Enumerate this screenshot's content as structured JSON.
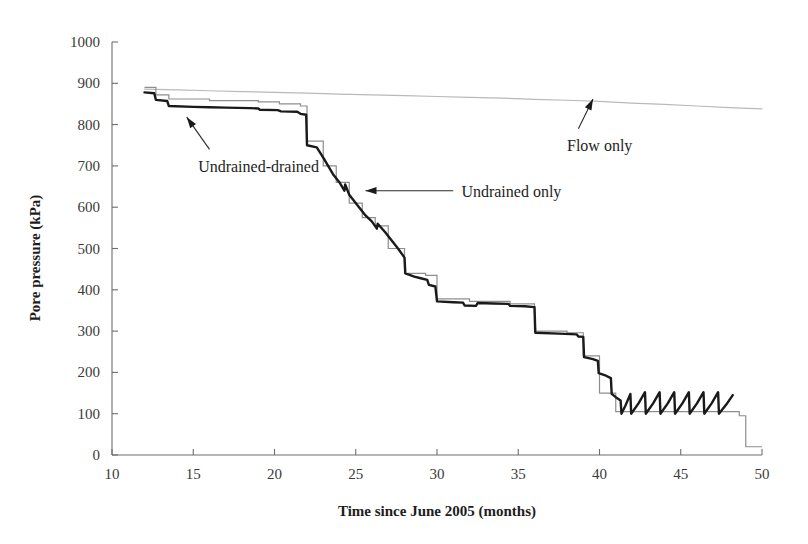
{
  "chart_data": {
    "type": "line",
    "title": "",
    "xlabel": "Time since June 2005 (months)",
    "ylabel": "Pore pressure (kPa)",
    "xlim": [
      10,
      50
    ],
    "ylim": [
      0,
      1000
    ],
    "xticks": [
      10,
      15,
      20,
      25,
      30,
      35,
      40,
      45,
      50
    ],
    "yticks": [
      0,
      100,
      200,
      300,
      400,
      500,
      600,
      700,
      800,
      900,
      1000
    ],
    "xtick_labels": [
      "10",
      "15",
      "20",
      "25",
      "30",
      "35",
      "40",
      "45",
      "50"
    ],
    "ytick_labels": [
      "0",
      "100",
      "200",
      "300",
      "400",
      "500",
      "600",
      "700",
      "800",
      "900",
      "1000"
    ],
    "grid": false,
    "legend": "none (inline annotations with leader arrows)",
    "series": [
      {
        "name": "Flow only",
        "style": "thin smooth curve, light grey",
        "color": "#b9b9b9",
        "points": [
          [
            12.0,
            886
          ],
          [
            14.0,
            884
          ],
          [
            16.0,
            882
          ],
          [
            18.0,
            880
          ],
          [
            20.0,
            878
          ],
          [
            22.0,
            876
          ],
          [
            24.0,
            874
          ],
          [
            26.0,
            872
          ],
          [
            28.0,
            870
          ],
          [
            30.0,
            868
          ],
          [
            32.0,
            866
          ],
          [
            34.0,
            864
          ],
          [
            36.0,
            861
          ],
          [
            38.0,
            859
          ],
          [
            40.0,
            856
          ],
          [
            42.0,
            852
          ],
          [
            44.0,
            849
          ],
          [
            46.0,
            845
          ],
          [
            48.0,
            841
          ],
          [
            50.0,
            838
          ]
        ]
      },
      {
        "name": "Undrained only",
        "style": "thin grey step (staircase) function",
        "color": "#8e8e8e",
        "steps": [
          [
            12.0,
            890
          ],
          [
            12.7,
            890
          ],
          [
            12.7,
            872
          ],
          [
            13.5,
            872
          ],
          [
            13.5,
            862
          ],
          [
            16.0,
            862
          ],
          [
            16.0,
            858
          ],
          [
            19.0,
            858
          ],
          [
            19.0,
            855
          ],
          [
            20.3,
            855
          ],
          [
            20.3,
            850
          ],
          [
            21.6,
            850
          ],
          [
            21.6,
            845
          ],
          [
            22.0,
            845
          ],
          [
            22.0,
            760
          ],
          [
            23.0,
            760
          ],
          [
            23.0,
            700
          ],
          [
            23.8,
            700
          ],
          [
            23.8,
            660
          ],
          [
            24.6,
            660
          ],
          [
            24.6,
            610
          ],
          [
            25.4,
            610
          ],
          [
            25.4,
            575
          ],
          [
            26.2,
            575
          ],
          [
            26.2,
            555
          ],
          [
            27.0,
            555
          ],
          [
            27.0,
            500
          ],
          [
            28.0,
            500
          ],
          [
            28.0,
            440
          ],
          [
            29.3,
            440
          ],
          [
            29.3,
            435
          ],
          [
            30.0,
            435
          ],
          [
            30.0,
            378
          ],
          [
            32.0,
            378
          ],
          [
            32.0,
            372
          ],
          [
            34.5,
            372
          ],
          [
            34.5,
            366
          ],
          [
            36.0,
            366
          ],
          [
            36.0,
            300
          ],
          [
            38.0,
            300
          ],
          [
            38.0,
            296
          ],
          [
            39.0,
            296
          ],
          [
            39.0,
            240
          ],
          [
            40.0,
            240
          ],
          [
            40.0,
            150
          ],
          [
            41.0,
            150
          ],
          [
            41.0,
            105
          ],
          [
            48.6,
            105
          ],
          [
            48.6,
            95
          ],
          [
            49.0,
            95
          ],
          [
            49.0,
            20
          ],
          [
            50.0,
            20
          ]
        ]
      },
      {
        "name": "Undrained-drained",
        "style": "thick black line, stepped with sloped transitions, sawtooth oscillation after month 40",
        "color": "#1a1a1a",
        "points": [
          [
            12.0,
            878
          ],
          [
            12.6,
            876
          ],
          [
            12.7,
            860
          ],
          [
            13.4,
            857
          ],
          [
            13.5,
            845
          ],
          [
            15.0,
            843
          ],
          [
            16.0,
            842
          ],
          [
            17.0,
            841
          ],
          [
            18.5,
            840
          ],
          [
            19.0,
            839
          ],
          [
            19.1,
            836
          ],
          [
            20.2,
            835
          ],
          [
            20.4,
            832
          ],
          [
            21.4,
            831
          ],
          [
            21.6,
            826
          ],
          [
            21.95,
            824
          ],
          [
            22.0,
            750
          ],
          [
            22.6,
            745
          ],
          [
            23.0,
            720
          ],
          [
            23.6,
            680
          ],
          [
            24.0,
            660
          ],
          [
            24.3,
            640
          ],
          [
            24.35,
            655
          ],
          [
            24.6,
            630
          ],
          [
            25.2,
            600
          ],
          [
            25.6,
            580
          ],
          [
            26.0,
            565
          ],
          [
            26.3,
            548
          ],
          [
            26.35,
            560
          ],
          [
            26.8,
            540
          ],
          [
            27.2,
            520
          ],
          [
            27.6,
            500
          ],
          [
            28.0,
            478
          ],
          [
            28.05,
            440
          ],
          [
            28.6,
            432
          ],
          [
            29.0,
            428
          ],
          [
            29.4,
            424
          ],
          [
            29.5,
            412
          ],
          [
            29.9,
            408
          ],
          [
            30.0,
            372
          ],
          [
            31.0,
            370
          ],
          [
            31.6,
            369
          ],
          [
            31.7,
            362
          ],
          [
            32.4,
            361
          ],
          [
            32.5,
            368
          ],
          [
            33.5,
            367
          ],
          [
            34.4,
            366
          ],
          [
            34.5,
            361
          ],
          [
            35.4,
            360
          ],
          [
            36.0,
            358
          ],
          [
            36.05,
            296
          ],
          [
            37.5,
            294
          ],
          [
            38.6,
            292
          ],
          [
            38.7,
            287
          ],
          [
            39.0,
            286
          ],
          [
            39.05,
            237
          ],
          [
            39.6,
            232
          ],
          [
            39.9,
            228
          ],
          [
            39.95,
            198
          ],
          [
            40.4,
            192
          ],
          [
            40.7,
            186
          ],
          [
            40.75,
            148
          ],
          [
            41.0,
            140
          ],
          [
            41.3,
            132
          ],
          [
            41.35,
            100
          ],
          [
            41.6,
            120
          ],
          [
            41.9,
            148
          ],
          [
            41.95,
            100
          ],
          [
            42.4,
            125
          ],
          [
            42.8,
            152
          ],
          [
            42.85,
            100
          ],
          [
            43.3,
            125
          ],
          [
            43.7,
            152
          ],
          [
            43.75,
            100
          ],
          [
            44.2,
            125
          ],
          [
            44.6,
            152
          ],
          [
            44.65,
            100
          ],
          [
            45.1,
            125
          ],
          [
            45.5,
            152
          ],
          [
            45.55,
            100
          ],
          [
            46.0,
            125
          ],
          [
            46.4,
            152
          ],
          [
            46.45,
            100
          ],
          [
            46.9,
            125
          ],
          [
            47.3,
            152
          ],
          [
            47.35,
            100
          ],
          [
            47.8,
            122
          ],
          [
            48.2,
            145
          ]
        ]
      }
    ],
    "annotations": [
      {
        "text": "Undrained-drained",
        "text_x": 15.3,
        "text_y": 700,
        "arrow_from_x": 16.0,
        "arrow_from_y": 740,
        "arrow_to_x": 14.6,
        "arrow_to_y": 818
      },
      {
        "text": "Undrained only",
        "text_x": 31.5,
        "text_y": 640,
        "arrow_from_x": 31.0,
        "arrow_from_y": 640,
        "arrow_to_x": 25.6,
        "arrow_to_y": 640
      },
      {
        "text": "Flow only",
        "text_x": 38.0,
        "text_y": 750,
        "arrow_from_x": 38.7,
        "arrow_from_y": 790,
        "arrow_to_x": 39.6,
        "arrow_to_y": 862
      }
    ]
  },
  "colors": {
    "background": "#ffffff",
    "axis": "#6d6d6d",
    "text": "#1d1d1d",
    "flow_only": "#b9b9b9",
    "undrained_only": "#8e8e8e",
    "undrained_drained": "#1a1a1a"
  }
}
